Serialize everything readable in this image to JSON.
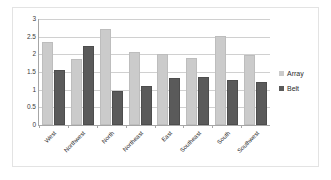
{
  "chart_data": {
    "type": "bar",
    "title": "",
    "subtitle": "",
    "xlabel": "",
    "ylabel": "",
    "ylim": [
      0,
      3
    ],
    "ytick_labels": [
      "3",
      "2.5",
      "2",
      "1.5",
      "1",
      "0.5",
      "0"
    ],
    "ytick_values": [
      3,
      2.5,
      2,
      1.5,
      1,
      0.5,
      0
    ],
    "grid": true,
    "legend_position": "right",
    "categories": [
      "West",
      "Northwest",
      "North",
      "Northeast",
      "East",
      "Southeast",
      "South",
      "Southwest"
    ],
    "series": [
      {
        "name": "Array",
        "color": "#cbcbcb",
        "values": [
          2.3,
          1.82,
          2.65,
          2.0,
          1.95,
          1.83,
          2.45,
          1.93
        ]
      },
      {
        "name": "Belt",
        "color": "#5a5a5a",
        "values": [
          1.51,
          2.18,
          0.9,
          1.04,
          1.28,
          1.31,
          1.23,
          1.17
        ]
      }
    ]
  },
  "legend": {
    "items": [
      {
        "label": "Array"
      },
      {
        "label": "Belt"
      }
    ]
  },
  "colors": {
    "array": "#cbcbcb",
    "belt": "#5a5a5a",
    "grid": "#d0d0d0",
    "axis": "#a6a6a6",
    "frame_border": "#e3e3e3",
    "background": "#ffffff"
  }
}
